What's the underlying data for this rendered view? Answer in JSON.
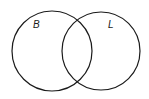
{
  "diagram": {
    "type": "venn",
    "sets": [
      {
        "label": "B",
        "cx": 52,
        "cy": 51,
        "r": 40
      },
      {
        "label": "L",
        "cx": 101,
        "cy": 51,
        "r": 39
      }
    ],
    "stroke_color": "#1a1a1a",
    "background": "#ffffff"
  }
}
